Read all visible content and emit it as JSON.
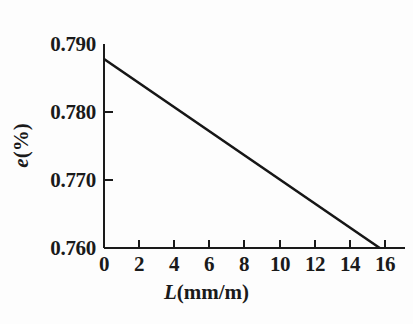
{
  "chart_data": {
    "type": "line",
    "title": "",
    "xlabel": "L(mm/m)",
    "xlabel_symbol": "L",
    "xlabel_unit": "(mm/m)",
    "ylabel": "e(%)",
    "ylabel_symbol": "e",
    "ylabel_unit": "(%)",
    "xlim": [
      0,
      16
    ],
    "ylim": [
      0.76,
      0.79
    ],
    "grid": false,
    "legend": "none",
    "line_color": "#161616",
    "background_color": "#fdfdfd",
    "xticks": [
      "0",
      "2",
      "4",
      "6",
      "8",
      "10",
      "12",
      "14",
      "16"
    ],
    "xtick_values": [
      0,
      2,
      4,
      6,
      8,
      10,
      12,
      14,
      16
    ],
    "yticks": [
      "0.760",
      "0.770",
      "0.780",
      "0.790"
    ],
    "ytick_values": [
      0.76,
      0.77,
      0.78,
      0.79
    ],
    "series": [
      {
        "name": "e vs L",
        "x": [
          0,
          15.7
        ],
        "values": [
          0.7878,
          0.76
        ]
      }
    ]
  }
}
